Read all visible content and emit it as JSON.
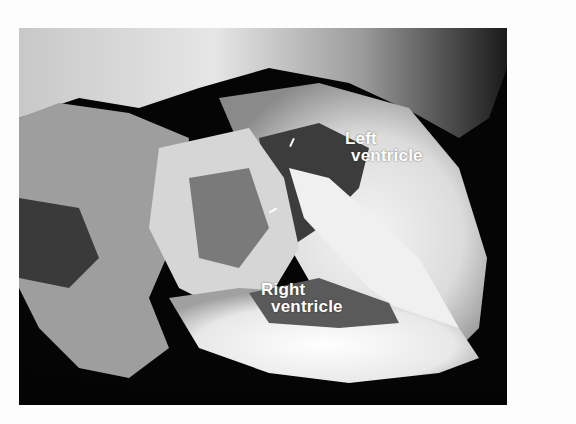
{
  "figure": {
    "labels": [
      {
        "line1": "Left",
        "line2": "ventricle"
      },
      {
        "line1": "Right",
        "line2": "ventricle"
      }
    ],
    "annotation_arrows": 2,
    "colors": {
      "background": "#fdfdfd",
      "photo_dark": "#050505",
      "tissue_light": "#f2f2f2",
      "tissue_mid": "#9a9a9a",
      "label_text": "#ffffff"
    }
  }
}
